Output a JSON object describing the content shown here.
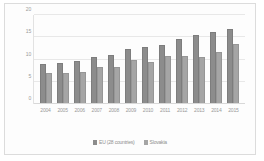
{
  "chart_data": {
    "type": "bar",
    "title": "",
    "xlabel": "",
    "ylabel": "",
    "ylim": [
      0,
      20
    ],
    "yticks": [
      20,
      15,
      10,
      5,
      0
    ],
    "grid": true,
    "legend_position": "bottom",
    "categories": [
      "2004",
      "2005",
      "2006",
      "2007",
      "2008",
      "2009",
      "2010",
      "2011",
      "2012",
      "2013",
      "2014",
      "2015"
    ],
    "series": [
      {
        "name": "EU (28 countries)",
        "color": "#8c8c8c",
        "values": [
          9.1,
          9.3,
          9.7,
          10.5,
          11.0,
          12.3,
          12.8,
          13.3,
          14.5,
          15.4,
          16.2,
          16.9
        ]
      },
      {
        "name": "Slovakia",
        "color": "#a5a5a5",
        "values": [
          6.9,
          6.9,
          7.1,
          8.4,
          8.3,
          9.8,
          9.5,
          10.8,
          10.9,
          10.6,
          11.8,
          13.4
        ]
      }
    ]
  }
}
